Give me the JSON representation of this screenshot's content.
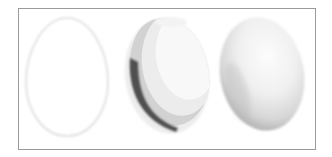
{
  "illustration": {
    "description": "Three eggs demonstrating shading stages",
    "frame": {
      "x": 18,
      "y": 8,
      "width": 296,
      "height": 140,
      "border_color": "#9a9a9a"
    },
    "eggs": [
      {
        "name": "egg-outline",
        "stage": "outline",
        "cx": 67,
        "cy": 77,
        "rx": 41,
        "ry": 59,
        "rotate": 0,
        "stroke": "#e6e6e6"
      },
      {
        "name": "egg-flat-tones",
        "stage": "flat tonal bands",
        "cx": 167,
        "cy": 76,
        "rx": 42,
        "ry": 58,
        "rotate": -8,
        "colors": {
          "highlight": "#f7f7f7",
          "light": "#ececec",
          "mid": "#cfcfcf",
          "dark": "#555555"
        }
      },
      {
        "name": "egg-gradient",
        "stage": "smooth gradient shading",
        "cx": 262,
        "cy": 74,
        "rx": 42,
        "ry": 57,
        "rotate": -10,
        "colors": {
          "highlight": "#fbfbfb",
          "mid": "#e2e2e2",
          "shadow": "#9c9c9c"
        }
      }
    ]
  }
}
